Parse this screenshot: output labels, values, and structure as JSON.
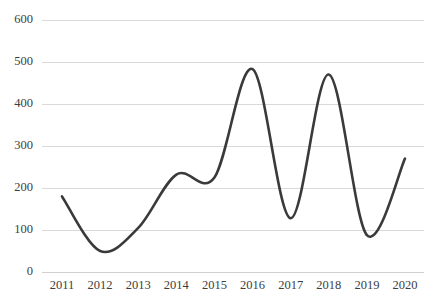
{
  "chart_data": {
    "type": "line",
    "title": "",
    "subtitle": "",
    "xlabel": "",
    "ylabel": "",
    "categories": [
      "2011",
      "2012",
      "2013",
      "2014",
      "2015",
      "2016",
      "2017",
      "2018",
      "2019",
      "2020"
    ],
    "values": [
      180,
      50,
      105,
      232,
      225,
      483,
      128,
      470,
      88,
      270
    ],
    "series": [
      {
        "name": "",
        "values": [
          180,
          50,
          105,
          232,
          225,
          483,
          128,
          470,
          88,
          270
        ]
      }
    ],
    "ylim": [
      0,
      600
    ],
    "xlim": [
      "2011",
      "2020"
    ],
    "ytick_labels": [
      "0",
      "100",
      "200",
      "300",
      "400",
      "500",
      "600"
    ],
    "ytick_values": [
      0,
      100,
      200,
      300,
      400,
      500,
      600
    ],
    "xtick_labels": [
      "2011",
      "2012",
      "2013",
      "2014",
      "2015",
      "2016",
      "2017",
      "2018",
      "2019",
      "2020"
    ],
    "grid": "horizontal",
    "legend": "none",
    "smoothing": "spline",
    "line_color": "#3a3a3a",
    "line_width": 2.6,
    "grid_color": "#d9d9d9",
    "background_color": "#ffffff",
    "tick_label_color": "#3d3d3d"
  }
}
